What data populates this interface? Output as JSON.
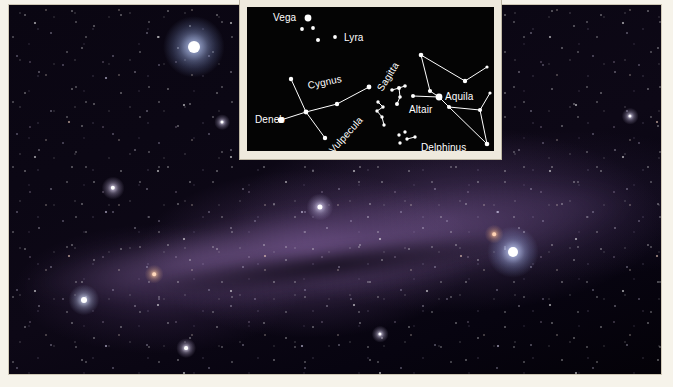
{
  "photo": {
    "name": "milky-way-summer-triangle-photograph",
    "description": "Wide-field night sky photograph of the summer Milky Way",
    "bright_stars": [
      {
        "name": "vega-bright-star",
        "label": "Vega",
        "x": 186,
        "y": 43,
        "radius": 6.0,
        "color": "#ffffff",
        "glow": "#9fb8ff"
      },
      {
        "name": "altair-bright-star",
        "label": "Altair",
        "x": 505,
        "y": 248,
        "radius": 5.0,
        "color": "#ffffff",
        "glow": "#a8bcff"
      },
      {
        "name": "deneb-bright-star",
        "label": "Deneb",
        "x": 312,
        "y": 203,
        "radius": 2.6,
        "color": "#ffffff",
        "glow": "#c2b6e8"
      },
      {
        "name": "field-star-left",
        "label": "",
        "x": 76,
        "y": 296,
        "radius": 3.0,
        "color": "#ffffff",
        "glow": "#b9c6f2"
      },
      {
        "name": "field-star-lower-left",
        "label": "",
        "x": 105,
        "y": 184,
        "radius": 2.2,
        "color": "#ffffff",
        "glow": "#cdbfe8"
      },
      {
        "name": "field-star-mid",
        "label": "",
        "x": 178,
        "y": 344,
        "radius": 1.9,
        "color": "#ffffff",
        "glow": "#d4c7ee"
      },
      {
        "name": "field-star-ruddy",
        "label": "",
        "x": 146,
        "y": 270,
        "radius": 1.8,
        "color": "#ffd8bc",
        "glow": "#e0a882"
      },
      {
        "name": "field-star-right-upper",
        "label": "",
        "x": 486,
        "y": 230,
        "radius": 1.8,
        "color": "#ffd2b4",
        "glow": "#d89a78"
      },
      {
        "name": "field-star-far-right",
        "label": "",
        "x": 622,
        "y": 112,
        "radius": 1.6,
        "color": "#ffffff",
        "glow": "#c9c0e6"
      },
      {
        "name": "field-star-bottom-mid",
        "label": "",
        "x": 372,
        "y": 330,
        "radius": 1.6,
        "color": "#ffffff",
        "glow": "#cfc4ea"
      },
      {
        "name": "field-star-upper-mid",
        "label": "",
        "x": 214,
        "y": 118,
        "radius": 1.5,
        "color": "#ffffff",
        "glow": "#c7bde4"
      }
    ]
  },
  "inset": {
    "name": "constellation-chart-inset",
    "background_color": "#040404",
    "frame_color": "#efeade",
    "star_color": "#ffffff",
    "line_color": "#ffffff",
    "labels": [
      {
        "id": "vega",
        "text": "Vega",
        "x": 26,
        "y": 6,
        "rotation": 0,
        "anchor": "left"
      },
      {
        "id": "lyra",
        "text": "Lyra",
        "x": 97,
        "y": 26,
        "rotation": 0,
        "anchor": "left"
      },
      {
        "id": "cygnus",
        "text": "Cygnus",
        "x": 62,
        "y": 74,
        "rotation": -12,
        "anchor": "left"
      },
      {
        "id": "deneb",
        "text": "Deneb",
        "x": 8,
        "y": 108,
        "rotation": 0,
        "anchor": "left"
      },
      {
        "id": "vulpecula",
        "text": "Vulpecula",
        "x": 88,
        "y": 138,
        "rotation": -48,
        "anchor": "left"
      },
      {
        "id": "sagitta",
        "text": "Sagitta",
        "x": 137,
        "y": 76,
        "rotation": -58,
        "anchor": "left"
      },
      {
        "id": "altair",
        "text": "Altair",
        "x": 162,
        "y": 98,
        "rotation": 0,
        "anchor": "left"
      },
      {
        "id": "aquila",
        "text": "Aquila",
        "x": 198,
        "y": 85,
        "rotation": 0,
        "anchor": "left"
      },
      {
        "id": "delphinus",
        "text": "Delphinus",
        "x": 174,
        "y": 136,
        "rotation": 0,
        "anchor": "left"
      }
    ],
    "stars": [
      {
        "id": "vega-star",
        "x": 61,
        "y": 11,
        "r": 3.4
      },
      {
        "id": "lyra-a",
        "x": 55,
        "y": 22,
        "r": 1.9
      },
      {
        "id": "lyra-b",
        "x": 66,
        "y": 21,
        "r": 1.9
      },
      {
        "id": "lyra-c",
        "x": 71,
        "y": 33,
        "r": 2.0
      },
      {
        "id": "lyra-d",
        "x": 88,
        "y": 30,
        "r": 1.9
      },
      {
        "id": "cyg-north",
        "x": 44,
        "y": 72,
        "r": 2.2
      },
      {
        "id": "cyg-center",
        "x": 59,
        "y": 105,
        "r": 2.4
      },
      {
        "id": "cyg-south",
        "x": 78,
        "y": 131,
        "r": 2.2
      },
      {
        "id": "deneb-star",
        "x": 34,
        "y": 113,
        "r": 3.1
      },
      {
        "id": "cyg-mid-e",
        "x": 90,
        "y": 97,
        "r": 2.2
      },
      {
        "id": "cyg-east",
        "x": 122,
        "y": 80,
        "r": 2.4
      },
      {
        "id": "vul-a",
        "x": 131,
        "y": 95,
        "r": 1.7
      },
      {
        "id": "vul-b",
        "x": 136,
        "y": 100,
        "r": 1.7
      },
      {
        "id": "vul-c",
        "x": 130,
        "y": 104,
        "r": 1.7
      },
      {
        "id": "vul-d",
        "x": 135,
        "y": 110,
        "r": 1.7
      },
      {
        "id": "vul-e",
        "x": 137,
        "y": 118,
        "r": 1.7
      },
      {
        "id": "sag-a",
        "x": 145,
        "y": 83,
        "r": 1.8
      },
      {
        "id": "sag-b",
        "x": 152,
        "y": 81,
        "r": 2.0
      },
      {
        "id": "sag-c",
        "x": 158,
        "y": 79,
        "r": 1.8
      },
      {
        "id": "sag-d",
        "x": 153,
        "y": 90,
        "r": 1.8
      },
      {
        "id": "sag-e",
        "x": 150,
        "y": 97,
        "r": 2.0
      },
      {
        "id": "aql-top",
        "x": 174,
        "y": 48,
        "r": 2.3
      },
      {
        "id": "aql-upper-e",
        "x": 218,
        "y": 74,
        "r": 2.2
      },
      {
        "id": "aql-tip-e",
        "x": 240,
        "y": 60,
        "r": 1.6
      },
      {
        "id": "aql-neck",
        "x": 183,
        "y": 84,
        "r": 2.1
      },
      {
        "id": "altair-star",
        "x": 192,
        "y": 90,
        "r": 3.4
      },
      {
        "id": "aql-west",
        "x": 166,
        "y": 89,
        "r": 2.0
      },
      {
        "id": "aql-south-w",
        "x": 202,
        "y": 100,
        "r": 2.0
      },
      {
        "id": "aql-east",
        "x": 233,
        "y": 103,
        "r": 2.1
      },
      {
        "id": "aql-ne-tip",
        "x": 243,
        "y": 86,
        "r": 1.6
      },
      {
        "id": "aql-tail",
        "x": 240,
        "y": 137,
        "r": 2.3
      },
      {
        "id": "del-a",
        "x": 152,
        "y": 128,
        "r": 1.7
      },
      {
        "id": "del-b",
        "x": 158,
        "y": 125,
        "r": 1.7
      },
      {
        "id": "del-c",
        "x": 160,
        "y": 132,
        "r": 1.7
      },
      {
        "id": "del-d",
        "x": 153,
        "y": 136,
        "r": 1.7
      },
      {
        "id": "del-e",
        "x": 168,
        "y": 130,
        "r": 1.7
      }
    ],
    "lines": [
      {
        "id": "cygnus-spine-1",
        "from": "cyg-north",
        "to": "cyg-center"
      },
      {
        "id": "cygnus-spine-2",
        "from": "cyg-center",
        "to": "cyg-south"
      },
      {
        "id": "cygnus-wing-1",
        "from": "deneb-star",
        "to": "cyg-center"
      },
      {
        "id": "cygnus-wing-2",
        "from": "cyg-center",
        "to": "cyg-mid-e"
      },
      {
        "id": "cygnus-wing-3",
        "from": "cyg-mid-e",
        "to": "cyg-east"
      },
      {
        "id": "vulpecula-1",
        "from": "vul-a",
        "to": "vul-b"
      },
      {
        "id": "vulpecula-2",
        "from": "vul-b",
        "to": "vul-c"
      },
      {
        "id": "vulpecula-3",
        "from": "vul-c",
        "to": "vul-d"
      },
      {
        "id": "vulpecula-4",
        "from": "vul-d",
        "to": "vul-e"
      },
      {
        "id": "sagitta-1",
        "from": "sag-a",
        "to": "sag-b"
      },
      {
        "id": "sagitta-2",
        "from": "sag-b",
        "to": "sag-c"
      },
      {
        "id": "sagitta-3",
        "from": "sag-b",
        "to": "sag-d"
      },
      {
        "id": "sagitta-4",
        "from": "sag-d",
        "to": "sag-e"
      },
      {
        "id": "aquila-1",
        "from": "aql-top",
        "to": "aql-upper-e"
      },
      {
        "id": "aquila-2",
        "from": "aql-upper-e",
        "to": "aql-tip-e"
      },
      {
        "id": "aquila-3",
        "from": "aql-top",
        "to": "aql-neck"
      },
      {
        "id": "aquila-4",
        "from": "aql-neck",
        "to": "altair-star"
      },
      {
        "id": "aquila-5",
        "from": "aql-west",
        "to": "altair-star"
      },
      {
        "id": "aquila-6",
        "from": "altair-star",
        "to": "aql-south-w"
      },
      {
        "id": "aquila-7",
        "from": "aql-south-w",
        "to": "aql-east"
      },
      {
        "id": "aquila-8",
        "from": "aql-east",
        "to": "aql-ne-tip"
      },
      {
        "id": "aquila-9",
        "from": "aql-east",
        "to": "aql-tail"
      },
      {
        "id": "aquila-10",
        "from": "aql-south-w",
        "to": "aql-tail"
      },
      {
        "id": "delphinus-1",
        "from": "del-c",
        "to": "del-e"
      }
    ]
  }
}
